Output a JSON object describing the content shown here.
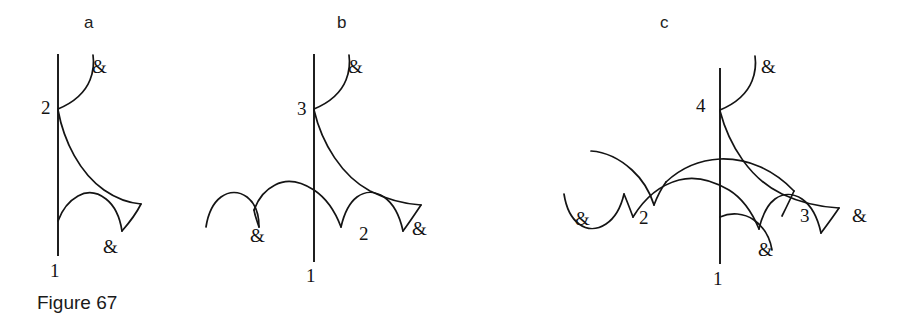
{
  "figure": {
    "caption": "Figure 67",
    "panels": [
      {
        "letter": "a",
        "letter_x": 84,
        "letter_y": 14,
        "axis_label_bottom": "1",
        "node_labels": [
          "2"
        ],
        "amp_labels": [
          "&",
          "&"
        ],
        "labels": [
          {
            "kind": "node",
            "text": "2",
            "x": 41,
            "y": 98
          },
          {
            "kind": "node",
            "text": "1",
            "x": 50,
            "y": 261
          },
          {
            "kind": "amp",
            "text": "&",
            "x": 92,
            "y": 57
          },
          {
            "kind": "amp",
            "text": "&",
            "x": 103,
            "y": 237
          }
        ]
      },
      {
        "letter": "b",
        "letter_x": 337,
        "letter_y": 14,
        "axis_label_bottom": "1",
        "node_labels": [
          "3",
          "2"
        ],
        "amp_labels": [
          "&",
          "&",
          "&"
        ],
        "labels": [
          {
            "kind": "node",
            "text": "3",
            "x": 297,
            "y": 99
          },
          {
            "kind": "node",
            "text": "1",
            "x": 306,
            "y": 266
          },
          {
            "kind": "node",
            "text": "2",
            "x": 359,
            "y": 224
          },
          {
            "kind": "amp",
            "text": "&",
            "x": 250,
            "y": 226
          },
          {
            "kind": "amp",
            "text": "&",
            "x": 412,
            "y": 219
          },
          {
            "kind": "amp",
            "text": "&",
            "x": 348,
            "y": 57
          }
        ]
      },
      {
        "letter": "c",
        "letter_x": 660,
        "letter_y": 14,
        "axis_label_bottom": "1",
        "node_labels": [
          "4",
          "2",
          "3"
        ],
        "amp_labels": [
          "&",
          "&",
          "&",
          "&"
        ],
        "labels": [
          {
            "kind": "node",
            "text": "4",
            "x": 696,
            "y": 96
          },
          {
            "kind": "node",
            "text": "1",
            "x": 713,
            "y": 269
          },
          {
            "kind": "node",
            "text": "2",
            "x": 639,
            "y": 208
          },
          {
            "kind": "node",
            "text": "3",
            "x": 800,
            "y": 206
          },
          {
            "kind": "amp",
            "text": "&",
            "x": 575,
            "y": 209
          },
          {
            "kind": "amp",
            "text": "&",
            "x": 758,
            "y": 240
          },
          {
            "kind": "amp",
            "text": "&",
            "x": 852,
            "y": 206
          },
          {
            "kind": "amp",
            "text": "&",
            "x": 761,
            "y": 57
          }
        ]
      }
    ],
    "colors": {
      "ink": "#141414",
      "background": "#ffffff",
      "caption_ink": "#1a1a1a"
    },
    "geometry": {
      "panel_a": {
        "axis": "M58,54 L58,256",
        "curves": [
          "M58,109 C70,104 84,95 90,80 C94,70 94,62 93,55",
          "M58,110 C64,140 80,172 104,190 C116,199 128,203 140,204",
          "M140,204 C134,213 128,222 122,230",
          "M122,230 C120,218 115,206 106,199 C98,193 88,191 79,195 C70,199 63,208 58,220"
        ]
      },
      "panel_b": {
        "axis": "M314,54 L314,262",
        "curves": [
          "M314,109 C326,104 340,95 346,80 C350,70 350,62 349,55",
          "M314,110 C322,142 340,175 368,190 C386,200 404,204 420,205",
          "M420,205 C414,214 408,222 402,230",
          "M402,230 C399,216 393,203 383,196 C374,190 364,190 356,196 C348,202 343,213 340,226",
          "M340,226 C334,210 326,197 314,189 C302,181 288,179 277,184 C267,188 260,197 256,209",
          "M256,209 C258,215 259,221 260,226",
          "M260,226 C260,214 256,203 248,197 C240,191 230,191 222,197 C214,203 209,214 207,226"
        ]
      },
      "panel_c": {
        "axis": "M720,68 L720,264",
        "curves": [
          "M720,110 C732,105 746,96 752,81 C756,71 756,63 755,56",
          "M720,111 C728,143 748,178 780,193 C800,202 820,206 838,207",
          "M838,207 C832,216 826,224 820,232",
          "M820,232 C817,218 811,205 801,198 C792,192 782,192 774,198 C766,204 761,215 758,228",
          "M758,228 C752,212 744,199 732,191 C716,181 700,177 686,180 C666,184 648,198 636,216",
          "M636,216 C632,208 628,200 624,193",
          "M624,193 C621,206 615,217 606,223 C597,229 587,229 579,223 C571,217 566,206 564,193",
          "M591,151 C604,151 616,157 626,166 C638,177 646,191 650,205",
          "M650,205 C654,196 658,188 663,181",
          "M663,181 C678,168 694,161 712,160 C740,159 768,170 790,190",
          "M790,190 C786,199 782,207 778,215"
        ]
      }
    }
  }
}
